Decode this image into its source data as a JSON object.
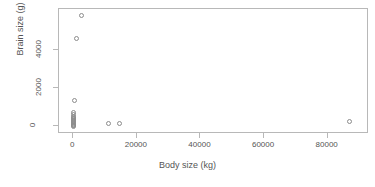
{
  "chart_data": {
    "type": "scatter",
    "title": "",
    "xlabel": "Body size (kg)",
    "ylabel": "Brain size (g)",
    "xlim": [
      -4500,
      93000
    ],
    "ylim": [
      -420,
      6150
    ],
    "xticks": [
      0,
      20000,
      40000,
      60000,
      80000
    ],
    "xticklabels": [
      "0",
      "20000",
      "40000",
      "60000",
      "80000"
    ],
    "yticks": [
      0,
      2000,
      4000
    ],
    "yticklabels": [
      "0",
      "2000",
      "4000"
    ],
    "grid": false,
    "legend": null,
    "marker": "open-circle",
    "marker_color": "#8c8c8c",
    "frame_color": "#b8b8b8",
    "background": "#ffffff",
    "points": [
      {
        "x": 2500,
        "y": 5800
      },
      {
        "x": 900,
        "y": 4600
      },
      {
        "x": 300,
        "y": 1350
      },
      {
        "x": 150,
        "y": 700
      },
      {
        "x": 150,
        "y": 600
      },
      {
        "x": 160,
        "y": 520
      },
      {
        "x": 140,
        "y": 440
      },
      {
        "x": 130,
        "y": 390
      },
      {
        "x": 120,
        "y": 330
      },
      {
        "x": 110,
        "y": 280
      },
      {
        "x": 100,
        "y": 220
      },
      {
        "x": 90,
        "y": 170
      },
      {
        "x": 80,
        "y": 120
      },
      {
        "x": 70,
        "y": 80
      },
      {
        "x": 60,
        "y": 40
      },
      {
        "x": 50,
        "y": 10
      },
      {
        "x": 40,
        "y": 0
      },
      {
        "x": 11000,
        "y": 120
      },
      {
        "x": 14600,
        "y": 120
      },
      {
        "x": 87000,
        "y": 220
      }
    ]
  }
}
